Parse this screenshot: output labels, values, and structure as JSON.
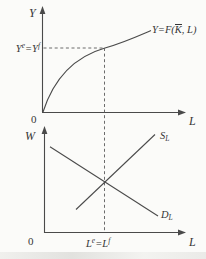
{
  "figure": {
    "colors": {
      "line": "#4a4a4a",
      "dashed_line": "#5a5a5a",
      "text": "#353535",
      "background": "#fbfbf9"
    },
    "top_panel": {
      "y_axis_label": "Y",
      "x_axis_label": "L",
      "origin_label": "0",
      "curve_label": {
        "pre": "Y=F(",
        "kbar": "K",
        "post": ", L)"
      },
      "output_level_label": {
        "base1": "Y",
        "sup1": "e",
        "eq": "=",
        "base2": "Y",
        "sup2": "f"
      }
    },
    "bottom_panel": {
      "y_axis_label": "W",
      "x_axis_label": "L",
      "origin_label": "0",
      "supply_label": {
        "base": "S",
        "sub": "L"
      },
      "demand_label": {
        "base": "D",
        "sub": "L"
      },
      "employment_level_label": {
        "base1": "L",
        "sup1": "e",
        "eq": "=",
        "base2": "L",
        "sup2": "f"
      }
    }
  }
}
